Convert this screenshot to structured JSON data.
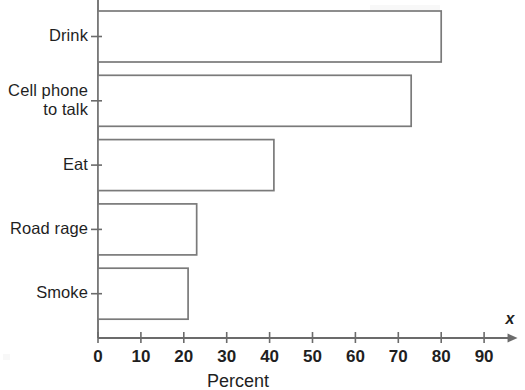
{
  "chart_data": {
    "type": "bar",
    "orientation": "horizontal",
    "title": "",
    "xlabel": "Percent",
    "ylabel": "",
    "x_axis_name": "x",
    "categories": [
      "Drink",
      "Cell phone\nto talk",
      "Eat",
      "Road rage",
      "Smoke"
    ],
    "values": [
      80,
      73,
      41,
      23,
      21
    ],
    "xlim": [
      0,
      95
    ],
    "xticks": [
      0,
      10,
      20,
      30,
      40,
      50,
      60,
      70,
      80,
      90
    ],
    "xtick_labels": [
      "0",
      "10",
      "20",
      "30",
      "40",
      "50",
      "60",
      "70",
      "80",
      "90"
    ],
    "grid": false,
    "legend": "none",
    "bar_fill": "#ffffff",
    "bar_stroke": "#7a7a7a",
    "axis_color": "#6b6b6b",
    "background": "#ffffff"
  },
  "axis": {
    "x_name": "x",
    "x_title": "Percent"
  },
  "bars": [
    {
      "label": "Drink",
      "value": 80
    },
    {
      "label": "Cell phone\nto talk",
      "value": 73
    },
    {
      "label": "Eat",
      "value": 41
    },
    {
      "label": "Road rage",
      "value": 23
    },
    {
      "label": "Smoke",
      "value": 21
    }
  ],
  "xticks": [
    {
      "label": "0",
      "value": 0
    },
    {
      "label": "10",
      "value": 10
    },
    {
      "label": "20",
      "value": 20
    },
    {
      "label": "30",
      "value": 30
    },
    {
      "label": "40",
      "value": 40
    },
    {
      "label": "50",
      "value": 50
    },
    {
      "label": "60",
      "value": 60
    },
    {
      "label": "70",
      "value": 70
    },
    {
      "label": "80",
      "value": 80
    },
    {
      "label": "90",
      "value": 90
    }
  ]
}
